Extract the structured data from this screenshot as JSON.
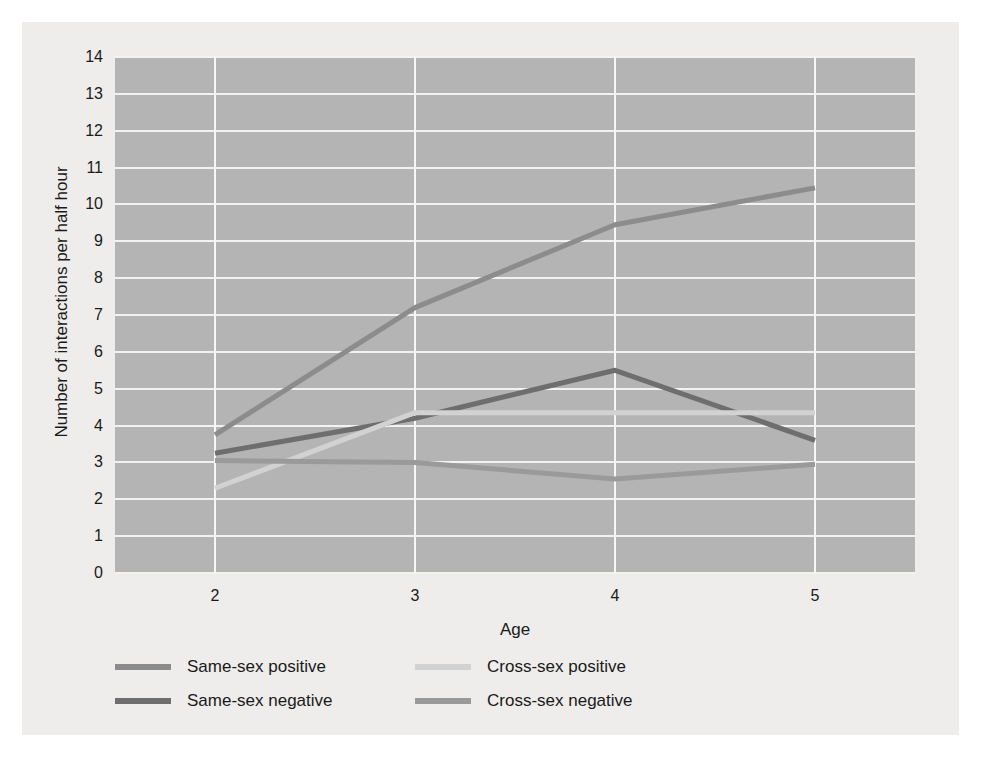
{
  "chart_data": {
    "type": "line",
    "title": "",
    "xlabel": "Age",
    "ylabel": "Number of interactions per half hour",
    "x": [
      2,
      3,
      4,
      5
    ],
    "xticklabels": [
      "2",
      "3",
      "4",
      "5"
    ],
    "yticklabels": [
      "0",
      "1",
      "2",
      "3",
      "4",
      "5",
      "6",
      "7",
      "8",
      "9",
      "10",
      "11",
      "12",
      "13",
      "14"
    ],
    "xlim": [
      1.5,
      5.5
    ],
    "ylim": [
      0,
      14
    ],
    "grid": "both",
    "legend_position": "below-plot",
    "series": [
      {
        "name": "Same-sex positive",
        "color": "#8c8c8c",
        "values": [
          3.75,
          7.2,
          9.45,
          10.45
        ]
      },
      {
        "name": "Same-sex negative",
        "color": "#6e6e6e",
        "values": [
          3.25,
          4.2,
          5.5,
          3.6
        ]
      },
      {
        "name": "Cross-sex positive",
        "color": "#d2d2d2",
        "values": [
          2.3,
          4.35,
          4.35,
          4.35
        ]
      },
      {
        "name": "Cross-sex negative",
        "color": "#9a9a9a",
        "values": [
          3.05,
          3.0,
          2.55,
          2.95
        ]
      }
    ]
  },
  "legend": {
    "items": [
      {
        "label": "Same-sex positive",
        "color": "#8c8c8c"
      },
      {
        "label": "Cross-sex positive",
        "color": "#d2d2d2"
      },
      {
        "label": "Same-sex negative",
        "color": "#6e6e6e"
      },
      {
        "label": "Cross-sex negative",
        "color": "#9a9a9a"
      }
    ]
  },
  "colors": {
    "page_background": "#ffffff",
    "figure_background": "#eeedeb",
    "plot_background": "#b4b4b4",
    "gridline": "#f2f2f0",
    "text": "#1a1a1a"
  }
}
